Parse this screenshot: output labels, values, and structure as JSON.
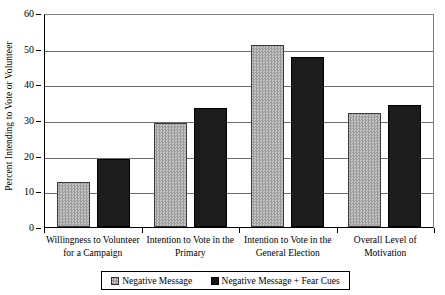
{
  "chart_data": {
    "type": "bar",
    "title": "",
    "xlabel": "",
    "ylabel": "Percent Intending to Vote or Volunteer",
    "ylim": [
      0,
      60
    ],
    "ytick_step": 10,
    "yticks": [
      60,
      50,
      40,
      30,
      20,
      10,
      0
    ],
    "grid": true,
    "legend_position": "bottom",
    "categories": [
      "Willingness to Volunteer for a Campaign",
      "Intention to Vote in the Primary",
      "Intention to Vote in the General Election",
      "Overall Level of Motivation"
    ],
    "category_lines": [
      [
        "Willingness to Volunteer",
        "for a Campaign"
      ],
      [
        "Intention to Vote in the",
        "Primary"
      ],
      [
        "Intention to Vote in the",
        "General Election"
      ],
      [
        "Overall Level of",
        "Motivation"
      ]
    ],
    "series": [
      {
        "name": "Negative Message",
        "color": "#a8a8a8",
        "pattern": "checkered",
        "values": [
          12.7,
          29.2,
          51.0,
          32.1
        ]
      },
      {
        "name": "Negative Message + Fear Cues",
        "color": "#1c1c1c",
        "pattern": "solid",
        "values": [
          19.1,
          33.4,
          47.7,
          34.2
        ]
      }
    ]
  },
  "legend": {
    "items": [
      {
        "label": "Negative Message"
      },
      {
        "label": "Negative Message + Fear Cues"
      }
    ]
  },
  "colors": {
    "series_a": "#a8a8a8",
    "series_b": "#1c1c1c",
    "gridline": "#6e6e6e",
    "axis": "#000000",
    "background": "#ffffff"
  }
}
